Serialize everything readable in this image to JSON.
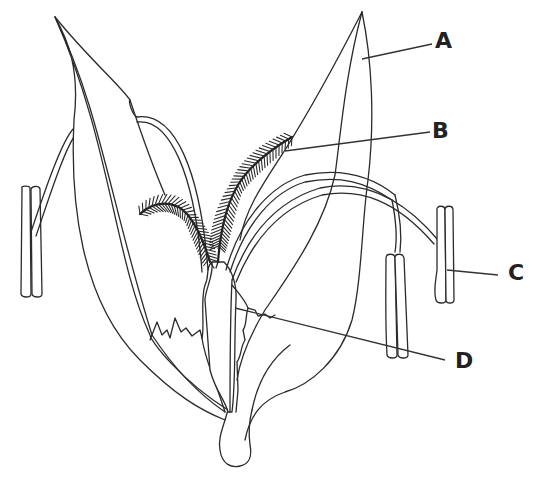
{
  "diagram": {
    "colors": {
      "stroke": "#2b2b2b",
      "background": "#ffffff",
      "label": "#222222"
    },
    "labels": [
      {
        "id": "A",
        "text": "A",
        "x": 435,
        "y": 30,
        "leader": {
          "x1": 362,
          "y1": 59,
          "x2": 432,
          "y2": 44
        }
      },
      {
        "id": "B",
        "text": "B",
        "x": 432,
        "y": 120,
        "leader": {
          "x1": 285,
          "y1": 151,
          "x2": 430,
          "y2": 132
        }
      },
      {
        "id": "C",
        "text": "C",
        "x": 508,
        "y": 262,
        "leader": {
          "x1": 447,
          "y1": 270,
          "x2": 498,
          "y2": 275
        }
      },
      {
        "id": "D",
        "text": "D",
        "x": 455,
        "y": 350,
        "leader": {
          "x1": 235,
          "y1": 308,
          "x2": 445,
          "y2": 360
        }
      }
    ]
  }
}
